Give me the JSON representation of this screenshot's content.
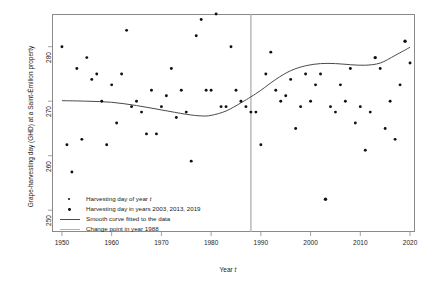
{
  "chart_data": {
    "type": "scatter",
    "title": "",
    "xlabel": "Year t",
    "ylabel": "Grape-harvesting day (GHD) at a Saint-Émilion property",
    "xlim": [
      1948,
      2021
    ],
    "ylim": [
      286,
      246
    ],
    "y_axis_inverted": true,
    "xticks": [
      1950,
      1960,
      1970,
      1980,
      1990,
      2000,
      2010,
      2020
    ],
    "yticks": [
      250,
      260,
      270,
      280
    ],
    "grid": false,
    "legend_position": "bottom-left",
    "series": [
      {
        "name": "Harvesting day of year t",
        "type": "scatter",
        "marker": "filled-circle",
        "color": "#111111",
        "points": [
          [
            1950,
            280
          ],
          [
            1951,
            262
          ],
          [
            1952,
            257
          ],
          [
            1953,
            276
          ],
          [
            1954,
            263
          ],
          [
            1955,
            278
          ],
          [
            1956,
            274
          ],
          [
            1957,
            275
          ],
          [
            1958,
            270
          ],
          [
            1959,
            262
          ],
          [
            1960,
            273
          ],
          [
            1961,
            266
          ],
          [
            1962,
            275
          ],
          [
            1963,
            283
          ],
          [
            1964,
            269
          ],
          [
            1965,
            270
          ],
          [
            1966,
            268
          ],
          [
            1967,
            264
          ],
          [
            1968,
            272
          ],
          [
            1969,
            264
          ],
          [
            1970,
            269
          ],
          [
            1971,
            271
          ],
          [
            1972,
            276
          ],
          [
            1973,
            267
          ],
          [
            1974,
            272
          ],
          [
            1975,
            268
          ],
          [
            1976,
            259
          ],
          [
            1977,
            282
          ],
          [
            1978,
            285
          ],
          [
            1979,
            272
          ],
          [
            1980,
            272
          ],
          [
            1981,
            286
          ],
          [
            1982,
            269
          ],
          [
            1983,
            269
          ],
          [
            1984,
            280
          ],
          [
            1985,
            272
          ],
          [
            1986,
            270
          ],
          [
            1987,
            269
          ],
          [
            1988,
            268
          ],
          [
            1989,
            268
          ],
          [
            1990,
            262
          ],
          [
            1991,
            275
          ],
          [
            1992,
            279
          ],
          [
            1993,
            272
          ],
          [
            1994,
            270
          ],
          [
            1995,
            271
          ],
          [
            1996,
            274
          ],
          [
            1997,
            265
          ],
          [
            1998,
            269
          ],
          [
            1999,
            275
          ],
          [
            2000,
            270
          ],
          [
            2001,
            273
          ],
          [
            2002,
            275
          ],
          [
            2004,
            269
          ],
          [
            2005,
            268
          ],
          [
            2006,
            273
          ],
          [
            2007,
            270
          ],
          [
            2008,
            276
          ],
          [
            2009,
            266
          ],
          [
            2010,
            269
          ],
          [
            2011,
            261
          ],
          [
            2012,
            268
          ],
          [
            2014,
            276
          ],
          [
            2015,
            265
          ],
          [
            2016,
            270
          ],
          [
            2017,
            263
          ],
          [
            2018,
            273
          ],
          [
            2020,
            277
          ]
        ]
      },
      {
        "name": "Harvesting day in years 2003, 2013, 2019",
        "type": "scatter",
        "marker": "filled-square-bold",
        "color": "#111111",
        "points": [
          [
            2003,
            252
          ],
          [
            2013,
            278
          ],
          [
            2019,
            281
          ]
        ]
      },
      {
        "name": "Smooth curve fitted to the data",
        "type": "line",
        "color": "#4a4a4a",
        "points": [
          [
            1950,
            270.1
          ],
          [
            1955,
            270.0
          ],
          [
            1960,
            269.8
          ],
          [
            1965,
            269.2
          ],
          [
            1970,
            268.4
          ],
          [
            1975,
            267.6
          ],
          [
            1978,
            267.3
          ],
          [
            1980,
            267.4
          ],
          [
            1983,
            268.2
          ],
          [
            1986,
            269.7
          ],
          [
            1988,
            270.8
          ],
          [
            1990,
            272.0
          ],
          [
            1993,
            274.0
          ],
          [
            1996,
            275.6
          ],
          [
            1999,
            276.5
          ],
          [
            2002,
            276.9
          ],
          [
            2005,
            276.9
          ],
          [
            2008,
            276.7
          ],
          [
            2011,
            276.6
          ],
          [
            2014,
            277.0
          ],
          [
            2017,
            278.4
          ],
          [
            2020,
            279.9
          ]
        ]
      },
      {
        "name": "Change point in year 1988",
        "type": "vline",
        "color": "#b0b0b0",
        "x": 1988
      }
    ]
  },
  "axis": {
    "ylabel": "Grape-harvesting day (GHD) at a Saint-Émilion property",
    "xlabel_prefix": "Year ",
    "xlabel_italic": "t",
    "xtick_labels": [
      "1950",
      "1960",
      "1970",
      "1980",
      "1990",
      "2000",
      "2010",
      "2020"
    ],
    "ytick_labels": [
      "280",
      "270",
      "260",
      "250"
    ]
  },
  "legend": {
    "items": [
      {
        "key": "dot",
        "text_prefix": "Harvesting day of year ",
        "text_italic": "t",
        "text_suffix": ""
      },
      {
        "key": "dot",
        "text_prefix": "Harvesting day in years 2003, 2013, 2019",
        "text_italic": "",
        "text_suffix": ""
      },
      {
        "key": "line-dark",
        "text_prefix": "Smooth curve fitted to the data",
        "text_italic": "",
        "text_suffix": ""
      },
      {
        "key": "line-gray",
        "text_prefix": "Change point in year 1988",
        "text_italic": "",
        "text_suffix": ""
      }
    ]
  },
  "colors": {
    "point": "#111111",
    "curve": "#4a4a4a",
    "changepoint": "#b0b0b0",
    "frame": "#8a8a8a",
    "text": "#1a1a1a"
  }
}
